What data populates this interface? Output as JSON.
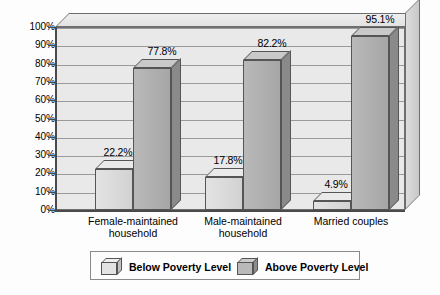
{
  "chart_data": {
    "type": "bar",
    "title": "",
    "subtitle": "",
    "xlabel": "",
    "ylabel": "",
    "ylim": [
      0,
      100
    ],
    "ytick_labels": [
      "0%",
      "10%",
      "20%",
      "30%",
      "40%",
      "50%",
      "60%",
      "70%",
      "80%",
      "90%",
      "100%"
    ],
    "ytick_values": [
      0,
      10,
      20,
      30,
      40,
      50,
      60,
      70,
      80,
      90,
      100
    ],
    "grid": true,
    "legend_position": "bottom",
    "categories": [
      "Female-maintained\nhousehold",
      "Male-maintained\nhousehold",
      "Married couples"
    ],
    "series": [
      {
        "name": "Below Poverty Level",
        "values": [
          22.2,
          17.8,
          4.9
        ],
        "value_labels": [
          "22.2%",
          "17.8%",
          "4.9%"
        ],
        "color": "#d8d8d8"
      },
      {
        "name": "Above Poverty Level",
        "values": [
          77.8,
          82.2,
          95.1
        ],
        "value_labels": [
          "77.8%",
          "82.2%",
          "95.1%"
        ],
        "color": "#b0b0b0"
      }
    ]
  },
  "legend": {
    "items": [
      {
        "label": "Below Poverty Level",
        "swatch": "light"
      },
      {
        "label": "Above Poverty Level",
        "swatch": "dark"
      }
    ]
  }
}
